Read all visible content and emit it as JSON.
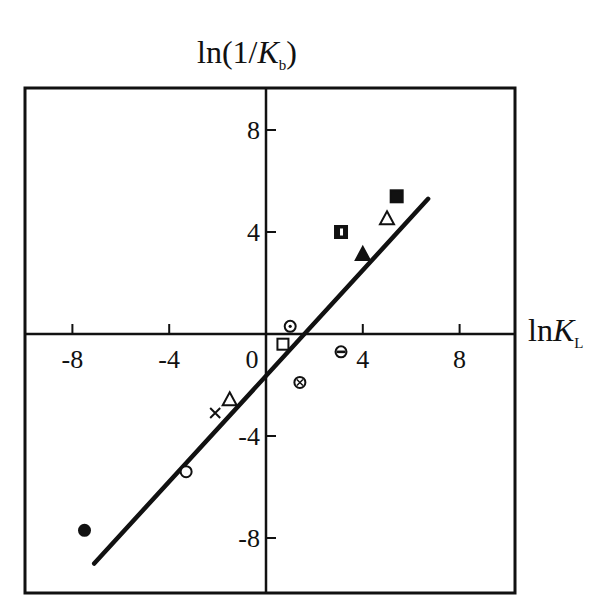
{
  "chart_data": {
    "type": "scatter",
    "title": "",
    "xlabel": "lnK_L",
    "ylabel": "ln(1/K_b)",
    "xlim": [
      -10,
      10
    ],
    "ylim": [
      -10,
      10
    ],
    "x_ticks": [
      -8,
      -4,
      0,
      4,
      8
    ],
    "y_ticks": [
      -8,
      -4,
      4,
      8
    ],
    "grid": false,
    "legend": null,
    "series": [
      {
        "name": "filled-circle",
        "marker": "filled-circle",
        "points": [
          [
            -7.5,
            -7.7
          ]
        ]
      },
      {
        "name": "open-circle",
        "marker": "open-circle",
        "points": [
          [
            -3.3,
            -5.4
          ]
        ]
      },
      {
        "name": "cross",
        "marker": "x",
        "points": [
          [
            -2.1,
            -3.1
          ]
        ]
      },
      {
        "name": "open-triangle",
        "marker": "open-triangle",
        "points": [
          [
            -1.5,
            -2.6
          ],
          [
            5.0,
            4.5
          ]
        ]
      },
      {
        "name": "open-square",
        "marker": "open-square",
        "points": [
          [
            0.7,
            -0.4
          ]
        ]
      },
      {
        "name": "dotted-circle",
        "marker": "circle-dot",
        "points": [
          [
            1.0,
            0.3
          ]
        ]
      },
      {
        "name": "crossed-circle",
        "marker": "circle-cross",
        "points": [
          [
            1.4,
            -1.9
          ]
        ]
      },
      {
        "name": "half-circle",
        "marker": "circle-bar",
        "points": [
          [
            3.1,
            -0.7
          ]
        ]
      },
      {
        "name": "half-filled-square",
        "marker": "square-half",
        "points": [
          [
            3.1,
            4.0
          ]
        ]
      },
      {
        "name": "filled-triangle",
        "marker": "filled-triangle",
        "points": [
          [
            4.0,
            3.1
          ]
        ]
      },
      {
        "name": "filled-square",
        "marker": "filled-square",
        "points": [
          [
            5.4,
            5.4
          ]
        ]
      }
    ],
    "fit_line": {
      "x": [
        -7.1,
        6.7
      ],
      "y": [
        -9.0,
        5.3
      ]
    }
  },
  "labels": {
    "y_prefix": "ln(1/",
    "y_var": "K",
    "y_sub": "b",
    "y_suffix": ")",
    "x_prefix": "ln",
    "x_var": "K",
    "x_sub": "L"
  }
}
